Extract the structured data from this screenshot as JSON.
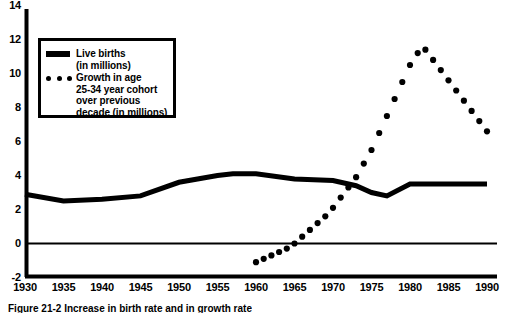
{
  "chart_data": {
    "type": "line",
    "title": "",
    "xlabel": "",
    "ylabel": "",
    "xlim": [
      1930,
      1990
    ],
    "ylim": [
      -2,
      14
    ],
    "ytick_values": [
      14,
      12,
      10,
      8,
      6,
      4,
      2,
      0,
      -2
    ],
    "ytick_labels": [
      "14",
      "12",
      "10",
      "8",
      "6",
      "4",
      "2",
      "0",
      "-2"
    ],
    "xtick_values": [
      1930,
      1935,
      1940,
      1945,
      1950,
      1955,
      1960,
      1965,
      1970,
      1975,
      1980,
      1985,
      1990
    ],
    "xtick_labels": [
      "1930",
      "1935",
      "1940",
      "1945",
      "1950",
      "1955",
      "1960",
      "1965",
      "1970",
      "1975",
      "1980",
      "1985",
      "1990"
    ],
    "grid": false,
    "zero_line": 0,
    "legend_position": "upper-left",
    "series": [
      {
        "name": "Live births (in millions)",
        "style": "solid-thick",
        "color": "#000000",
        "x": [
          1930,
          1935,
          1940,
          1945,
          1950,
          1955,
          1957,
          1960,
          1965,
          1970,
          1973,
          1975,
          1977,
          1980,
          1985,
          1990
        ],
        "values": [
          2.9,
          2.5,
          2.6,
          2.8,
          3.6,
          4.0,
          4.1,
          4.1,
          3.8,
          3.7,
          3.4,
          3.0,
          2.8,
          3.5,
          3.5,
          3.5
        ]
      },
      {
        "name": "Growth in age 25-34 year cohort over previous decade (in millions)",
        "style": "dotted",
        "color": "#000000",
        "x": [
          1960,
          1961,
          1962,
          1963,
          1964,
          1965,
          1966,
          1967,
          1968,
          1969,
          1970,
          1971,
          1972,
          1973,
          1974,
          1975,
          1976,
          1977,
          1978,
          1979,
          1980,
          1981,
          1982,
          1983,
          1984,
          1985,
          1986,
          1987,
          1988,
          1989,
          1990
        ],
        "values": [
          -1.1,
          -0.9,
          -0.7,
          -0.5,
          -0.3,
          0.0,
          0.4,
          0.8,
          1.2,
          1.6,
          2.1,
          2.7,
          3.3,
          3.9,
          4.7,
          5.5,
          6.5,
          7.5,
          8.5,
          9.5,
          10.5,
          11.2,
          11.4,
          10.8,
          10.2,
          9.6,
          9.0,
          8.4,
          7.8,
          7.2,
          6.6
        ]
      }
    ]
  },
  "legend": {
    "items": [
      {
        "marker": "solid-bar",
        "label": "Live births\n(in millions)"
      },
      {
        "marker": "dots",
        "label": "Growth in age\n25-34 year cohort\nover previous\ndecade (in millions)"
      }
    ]
  },
  "caption": {
    "text": "Figure 21-2   Increase in birth rate and in growth rate"
  }
}
